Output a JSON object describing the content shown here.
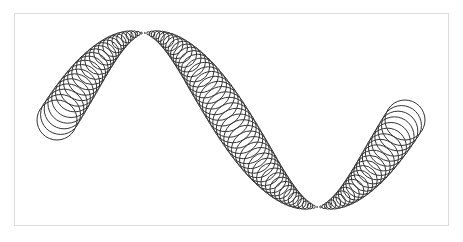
{
  "canvas": {
    "width": 463,
    "height": 242,
    "background": "#ffffff",
    "frame_color": "#dddddd",
    "stroke_color": "#333333"
  },
  "figure": {
    "wave": {
      "x_start": 57,
      "x_end": 405,
      "y_mid": 120,
      "amplitude": 87,
      "periods": 1
    },
    "circles": {
      "count": 100,
      "max_radius": 20,
      "radius_rule": "max_radius * |cos(theta)|"
    }
  }
}
